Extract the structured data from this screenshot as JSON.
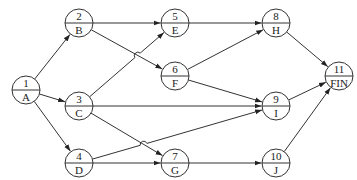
{
  "diagram": {
    "type": "activity-on-node network",
    "node_radius": 14,
    "nodes": [
      {
        "id": "1",
        "num": "1",
        "label": "A",
        "x": 26,
        "y": 90
      },
      {
        "id": "2",
        "num": "2",
        "label": "B",
        "x": 79,
        "y": 23
      },
      {
        "id": "3",
        "num": "3",
        "label": "C",
        "x": 79,
        "y": 106
      },
      {
        "id": "4",
        "num": "4",
        "label": "D",
        "x": 79,
        "y": 163
      },
      {
        "id": "5",
        "num": "5",
        "label": "E",
        "x": 175,
        "y": 23
      },
      {
        "id": "6",
        "num": "6",
        "label": "F",
        "x": 175,
        "y": 76
      },
      {
        "id": "7",
        "num": "7",
        "label": "G",
        "x": 175,
        "y": 163
      },
      {
        "id": "8",
        "num": "8",
        "label": "H",
        "x": 276,
        "y": 23
      },
      {
        "id": "9",
        "num": "9",
        "label": "I",
        "x": 276,
        "y": 106
      },
      {
        "id": "10",
        "num": "10",
        "label": "J",
        "x": 276,
        "y": 163
      },
      {
        "id": "11",
        "num": "11",
        "label": "FIN",
        "x": 339,
        "y": 76
      }
    ],
    "edges": [
      {
        "from": "1",
        "to": "2"
      },
      {
        "from": "1",
        "to": "3"
      },
      {
        "from": "1",
        "to": "4"
      },
      {
        "from": "2",
        "to": "5"
      },
      {
        "from": "2",
        "to": "6"
      },
      {
        "from": "3",
        "to": "5",
        "hop": true
      },
      {
        "from": "3",
        "to": "9"
      },
      {
        "from": "3",
        "to": "7"
      },
      {
        "from": "4",
        "to": "9",
        "hop": true
      },
      {
        "from": "4",
        "to": "7"
      },
      {
        "from": "5",
        "to": "8"
      },
      {
        "from": "6",
        "to": "8"
      },
      {
        "from": "6",
        "to": "9"
      },
      {
        "from": "7",
        "to": "10"
      },
      {
        "from": "8",
        "to": "11"
      },
      {
        "from": "9",
        "to": "11"
      },
      {
        "from": "10",
        "to": "11"
      }
    ]
  }
}
